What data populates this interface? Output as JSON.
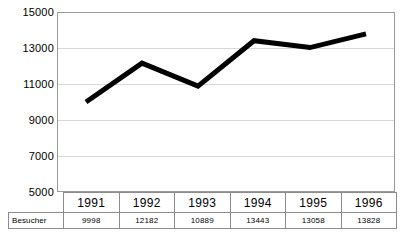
{
  "chart_data": {
    "type": "line",
    "title": "",
    "xlabel": "",
    "ylabel": "",
    "categories": [
      "1991",
      "1992",
      "1993",
      "1994",
      "1995",
      "1996"
    ],
    "series": [
      {
        "name": "Besucher",
        "values": [
          9998,
          12182,
          10889,
          13443,
          13058,
          13828
        ]
      }
    ],
    "ylim": [
      5000,
      15000
    ],
    "ytick_step": 2000,
    "yticks": [
      "15000",
      "13000",
      "11000",
      "9000",
      "7000",
      "5000"
    ],
    "ytick_values": [
      15000,
      13000,
      11000,
      9000,
      7000,
      5000
    ],
    "grid": true,
    "legend": false,
    "markers": false,
    "line_color": "#000000",
    "gridline_color": "#d8d8d8",
    "plot_border_color": "#9a9a9a",
    "table_border_color": "#8c8c8c"
  },
  "table": {
    "row_label": "Besucher",
    "headers": [
      "1991",
      "1992",
      "1993",
      "1994",
      "1995",
      "1996"
    ],
    "values": [
      "9998",
      "12182",
      "10889",
      "13443",
      "13058",
      "13828"
    ]
  }
}
